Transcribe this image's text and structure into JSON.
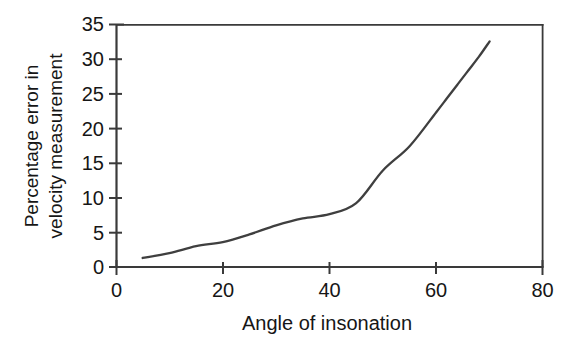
{
  "chart_data": {
    "type": "line",
    "title": "",
    "xlabel": "Angle of insonation",
    "ylabel": "Percentage error in velocity measurement",
    "ylabel_lines": [
      "Percentage error in",
      "velocity measurement"
    ],
    "xlim": [
      0,
      80
    ],
    "ylim": [
      0,
      35
    ],
    "xticks": [
      0,
      20,
      40,
      60,
      80
    ],
    "yticks": [
      0,
      5,
      10,
      15,
      20,
      25,
      30,
      35
    ],
    "xtick_labels": [
      "0",
      "20",
      "40",
      "60",
      "80"
    ],
    "ytick_labels": [
      "0",
      "5",
      "10",
      "15",
      "20",
      "25",
      "30",
      "35"
    ],
    "grid": false,
    "legend": false,
    "legend_position": "none",
    "line_color": "#3f3f3f",
    "frame_color": "#3a3a3a",
    "background_color": "#ffffff",
    "series": [
      {
        "name": "Percentage error in velocity measurement",
        "x": [
          5,
          10,
          15,
          20,
          25,
          30,
          35,
          40,
          45,
          50,
          55,
          60,
          62,
          64,
          66,
          68,
          70
        ],
        "values": [
          1.3,
          2.0,
          3.0,
          3.6,
          4.7,
          6.0,
          7.0,
          7.6,
          9.2,
          13.9,
          17.4,
          22.3,
          24.3,
          26.3,
          28.3,
          30.3,
          32.5
        ]
      }
    ]
  },
  "axes_geometry": {
    "x_px_min": 116,
    "x_px_max": 543,
    "y_px_min": 267,
    "y_px_max": 24
  }
}
